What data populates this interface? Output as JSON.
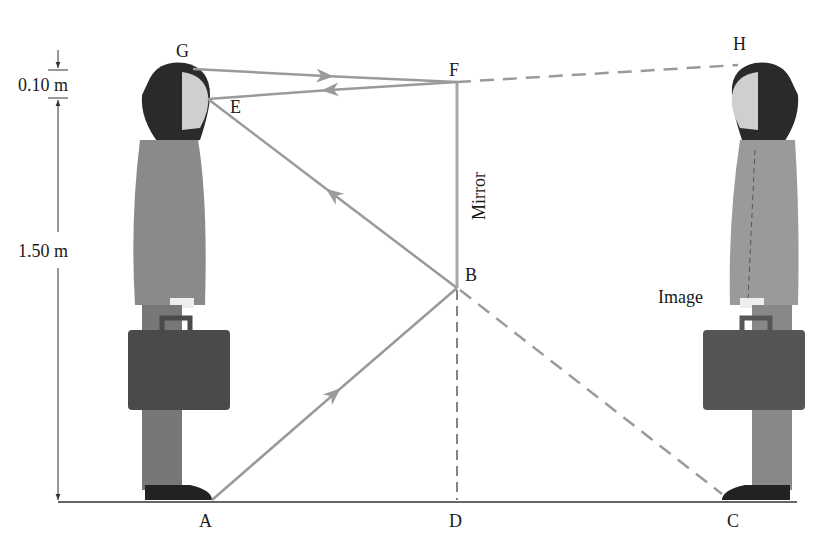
{
  "diagram": {
    "colors": {
      "ray": "#9a9a9a",
      "mirror": "#a8a8a8",
      "ground": "#333333",
      "text": "#1a1a1a",
      "hair": "#2a2a2a",
      "suit": "#8a8a8a",
      "briefcase": "#4a4a4a",
      "skin": "#cfcfcf"
    },
    "points": {
      "G": "G",
      "E": "E",
      "F": "F",
      "H": "H",
      "B": "B",
      "A": "A",
      "D": "D",
      "C": "C"
    },
    "labels": {
      "mirror": "Mirror",
      "image": "Image"
    },
    "dimensions": {
      "top_gap": "0.10 m",
      "eye_height": "1.50 m"
    },
    "rays": [
      {
        "from": "G",
        "to": "F",
        "style": "solid",
        "arrow": "toward F"
      },
      {
        "from": "F",
        "to": "E",
        "style": "solid",
        "arrow": "toward E"
      },
      {
        "from": "F",
        "to": "H",
        "style": "dashed"
      },
      {
        "from": "A",
        "to": "B",
        "style": "solid",
        "arrow": "toward B"
      },
      {
        "from": "B",
        "to": "E",
        "style": "solid",
        "arrow": "toward E"
      },
      {
        "from": "B",
        "to": "C",
        "style": "dashed"
      },
      {
        "from": "B",
        "to": "D",
        "style": "dashed"
      }
    ]
  }
}
